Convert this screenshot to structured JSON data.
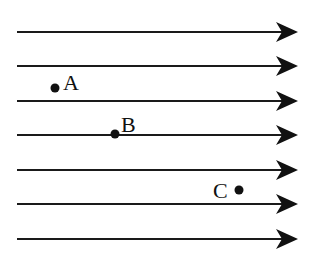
{
  "diagram": {
    "type": "uniform-field-lines",
    "colors": {
      "line": "#1a1a1a",
      "background": "#ffffff",
      "point": "#111111"
    },
    "field_lines": [
      {
        "y": 32
      },
      {
        "y": 66
      },
      {
        "y": 101
      },
      {
        "y": 135
      },
      {
        "y": 170
      },
      {
        "y": 204
      },
      {
        "y": 239
      }
    ],
    "line_start_x": 17,
    "line_end_x": 280,
    "arrow_tip_x": 298,
    "direction": "right",
    "points": [
      {
        "label": "A",
        "x": 55,
        "y": 88,
        "label_x": 63,
        "label_y": 90
      },
      {
        "label": "B",
        "x": 115,
        "y": 134,
        "label_x": 121,
        "label_y": 132
      },
      {
        "label": "C",
        "x": 239,
        "y": 190,
        "label_x": 213,
        "label_y": 198
      }
    ]
  }
}
